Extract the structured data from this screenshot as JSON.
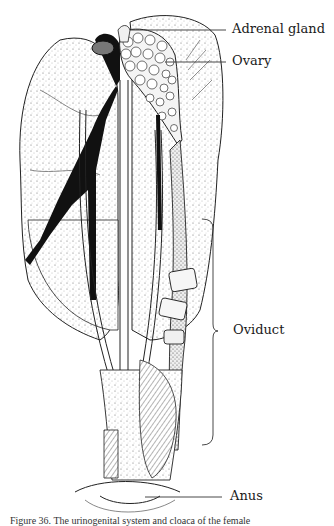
{
  "figure": {
    "labels": [
      {
        "id": "adrenal-gland",
        "text": "Adrenal gland"
      },
      {
        "id": "ovary",
        "text": "Ovary"
      },
      {
        "id": "oviduct",
        "text": "Oviduct"
      },
      {
        "id": "anus",
        "text": "Anus"
      }
    ],
    "caption": "Figure 36. The urinogenital system and cloaca of the female"
  }
}
